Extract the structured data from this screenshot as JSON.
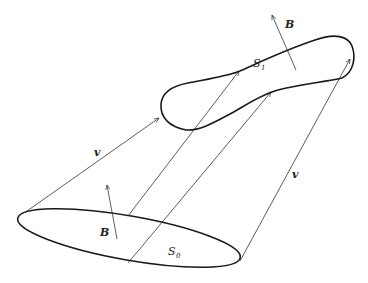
{
  "diagram": {
    "surfaces": [
      {
        "id": "S0",
        "label": "S",
        "subscript": "0"
      },
      {
        "id": "S1",
        "label": "S",
        "subscript": "1"
      }
    ],
    "vectors": {
      "field_label": "B",
      "velocity_label": "v"
    },
    "colors": {
      "stroke": "#1a1a1a",
      "thin": "#333333",
      "background": "#ffffff"
    }
  }
}
